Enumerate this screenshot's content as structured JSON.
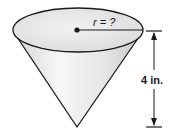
{
  "figure": {
    "shape": "cone",
    "radius_label": "r = ?",
    "height_label": "4 in.",
    "colors": {
      "stroke": "#1a1a1a",
      "fill_light": "#f4f4f4",
      "fill_shade": "#cfcfcf",
      "background": "#ffffff"
    }
  }
}
